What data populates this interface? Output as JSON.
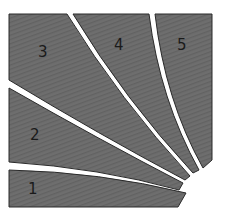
{
  "diagram": {
    "fill_color": "#6e6e6e",
    "stroke_color": "#2a2a2a",
    "gap_color": "#ffffff",
    "regions": [
      {
        "id": 1,
        "label": "1"
      },
      {
        "id": 2,
        "label": "2"
      },
      {
        "id": 3,
        "label": "3"
      },
      {
        "id": 4,
        "label": "4"
      },
      {
        "id": 5,
        "label": "5"
      }
    ]
  }
}
